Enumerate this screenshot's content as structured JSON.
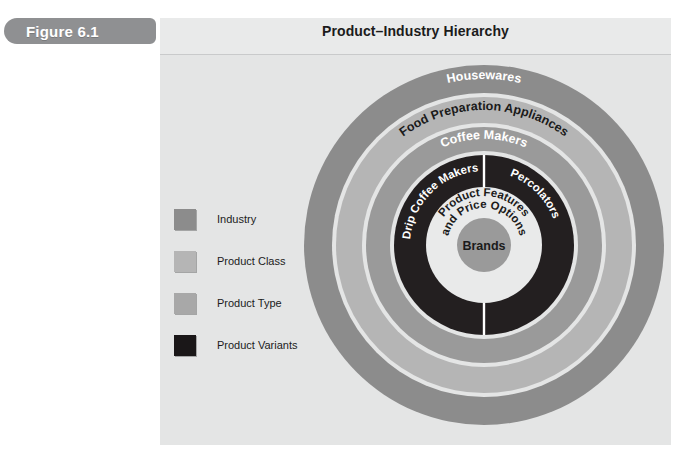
{
  "figure": {
    "tab_label": "Figure 6.1",
    "title": "Product–Industry Hierarchy"
  },
  "legend": {
    "items": [
      {
        "label": "Industry",
        "color": "#8c8c8c"
      },
      {
        "label": "Product Class",
        "color": "#b5b5b5"
      },
      {
        "label": "Product Type",
        "color": "#a8a8a8"
      },
      {
        "label": "Product Variants",
        "color": "#1a1718"
      }
    ]
  },
  "diagram": {
    "type": "concentric-rings",
    "center_label": "Brands",
    "rings": [
      {
        "level": 1,
        "name": "Industry",
        "label": "Housewares",
        "color": "#8c8c8c",
        "text_color": "#ffffff",
        "outer_radius": 180,
        "inner_radius": 152
      },
      {
        "level": 2,
        "name": "Product Class",
        "label": "Food Preparation Appliances",
        "color": "#b5b5b5",
        "text_color": "#1b1b1b",
        "outer_radius": 148,
        "inner_radius": 122
      },
      {
        "level": 3,
        "name": "Product Type",
        "label": "Coffee Makers",
        "color": "#9a9a9a",
        "text_color": "#ffffff",
        "outer_radius": 118,
        "inner_radius": 94
      },
      {
        "level": 4,
        "name": "Product Variants",
        "label": "Drip Coffee Makers / Percolators",
        "color": "#231f20",
        "text_color": "#ffffff",
        "outer_radius": 90,
        "inner_radius": 58
      },
      {
        "level": 5,
        "name": "Product Features",
        "label": "Product Features and Price Options",
        "color": "#e4e5e5",
        "text_color": "#1b1b1b",
        "outer_radius": 58,
        "inner_radius": 27
      },
      {
        "level": 6,
        "name": "Brands",
        "label": "Brands",
        "color": "#9a9a9a",
        "text_color": "#1b1b1b",
        "outer_radius": 27,
        "inner_radius": 0
      }
    ],
    "variant_segments": [
      {
        "label": "Drip Coffee Makers",
        "side": "left"
      },
      {
        "label": "Percolators",
        "side": "right"
      }
    ],
    "features_lines": [
      "Product Features",
      "and Price Options"
    ],
    "divider_color": "#ffffff"
  }
}
